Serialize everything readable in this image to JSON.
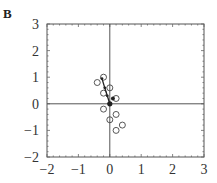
{
  "panel_label": "B",
  "chart_data": {
    "type": "scatter",
    "title": "",
    "xlabel": "",
    "ylabel": "",
    "xlim": [
      -2,
      3
    ],
    "ylim": [
      -2,
      3
    ],
    "x_ticks": [
      -2,
      -1,
      0,
      1,
      2,
      3
    ],
    "y_ticks": [
      -2,
      -1,
      0,
      1,
      2,
      3
    ],
    "x_tick_labels": [
      "−2",
      "−1",
      "0",
      "1",
      "2",
      "3"
    ],
    "y_tick_labels": [
      "−2",
      "−1",
      "0",
      "1",
      "2",
      "3"
    ],
    "grid": false,
    "zero_lines": true,
    "series": [
      {
        "name": "open circles",
        "marker": "open-circle",
        "points": [
          [
            -0.4,
            0.8
          ],
          [
            -0.2,
            1.0
          ],
          [
            -0.2,
            0.4
          ],
          [
            0.0,
            0.6
          ],
          [
            0.2,
            0.2
          ],
          [
            -0.2,
            -0.2
          ],
          [
            0.2,
            -0.4
          ],
          [
            0.0,
            -0.6
          ],
          [
            0.4,
            -0.8
          ],
          [
            0.2,
            -1.0
          ]
        ]
      },
      {
        "name": "mean vector",
        "marker": "filled-dot-line",
        "points": [
          [
            0.0,
            0.0
          ],
          [
            -0.08,
            0.3
          ],
          [
            -0.16,
            0.6
          ],
          [
            -0.25,
            0.95
          ]
        ]
      },
      {
        "name": "filled points",
        "marker": "filled-dot",
        "points": [
          [
            0.0,
            0.0
          ],
          [
            0.1,
            0.2
          ]
        ]
      }
    ]
  }
}
